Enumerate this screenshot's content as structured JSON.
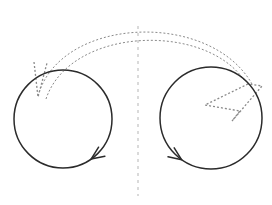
{
  "figure": {
    "width": 272,
    "height": 205,
    "background": "#ffffff",
    "title": ""
  },
  "colors": {
    "solid_stroke": "#2b2b2b",
    "dashed_stroke": "#8a8a8a",
    "axis_stroke": "#b5b5b5",
    "background": "#ffffff"
  },
  "strokes": {
    "circle_width": 1.5,
    "arc_width": 1.0,
    "axis_width": 1.0,
    "arrowhead_width": 1.3,
    "dash_arc_pattern": "2,2",
    "dash_axis_pattern": "3,4",
    "dash_head_pattern": "2,2"
  },
  "left_loop": {
    "label": "left-circle",
    "cx": 63,
    "cy": 119,
    "r": 49,
    "rotation": "clockwise",
    "arrow_angle_deg": 55,
    "arrow_label": "clockwise-rotation-arrow"
  },
  "right_loop": {
    "label": "right-circle",
    "cx": 211,
    "cy": 118,
    "r": 51,
    "rotation": "counter-clockwise",
    "arrow_angle_deg": 125,
    "arrow_label": "counter-clockwise-rotation-arrow"
  },
  "symmetry_axis": {
    "label": "vertical-dashed-axis",
    "x": 138,
    "y_top": 26,
    "y_bottom": 196
  },
  "transfer_arc": {
    "label": "dashed-double-arrow-arc",
    "outer_path": "M 38 96 C 60 16 210 10 252 84",
    "inner_path": "M 46 99 C 70 27 204 22 244 80",
    "left_head_label": "left-dashed-arrowhead",
    "right_head_label": "right-dashed-arrowhead",
    "left_head_path": "M 34 62 L 38 97 L 47 63",
    "right_head_path": "M 248 84 L 205 105 L 240 111 L 232 121 L 262 86 Z"
  },
  "annotations": {
    "texts": []
  }
}
